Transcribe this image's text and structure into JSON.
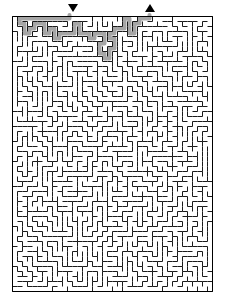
{
  "puzzle": {
    "type": "maze",
    "title": "Maze Puzzle",
    "description": "Rectangular perfect maze with solution path shown",
    "canvas": {
      "width": 227,
      "height": 301,
      "background": "#ffffff"
    },
    "frame": {
      "x": 12,
      "y": 16,
      "width": 200,
      "height": 275,
      "border_color": "#000000",
      "border_width": 1
    },
    "grid": {
      "columns": 40,
      "rows": 55,
      "cell_size": 5,
      "wall_color": "#1a1a1a",
      "wall_thickness": 1,
      "passage_color": "#ffffff"
    },
    "solution": {
      "label": "solution-path",
      "color": "#a6a6a6",
      "stroke_width": 4,
      "visible": true
    },
    "markers": [
      {
        "name": "entrance-marker",
        "glyph": "down-triangle",
        "symbol": "▼",
        "x": 68,
        "y": 4,
        "color": "#000000",
        "role": "entrance"
      },
      {
        "name": "exit-marker",
        "glyph": "up-triangle",
        "symbol": "▲",
        "x": 145,
        "y": 4,
        "color": "#000000",
        "role": "exit"
      }
    ],
    "entrance": {
      "column": 11,
      "row": 0
    },
    "exit": {
      "column": 27,
      "row": 0
    }
  },
  "maze_data": {
    "seed": 20240517,
    "algorithm": "recursive-backtracker",
    "solution_waypoints": [
      [
        11,
        0
      ],
      [
        11,
        1
      ],
      [
        11,
        2
      ],
      [
        11,
        3
      ],
      [
        12,
        3
      ],
      [
        13,
        3
      ],
      [
        13,
        4
      ],
      [
        13,
        5
      ],
      [
        14,
        5
      ],
      [
        15,
        5
      ],
      [
        15,
        6
      ],
      [
        15,
        7
      ],
      [
        16,
        7
      ],
      [
        17,
        7
      ],
      [
        17,
        8
      ],
      [
        17,
        9
      ],
      [
        18,
        9
      ],
      [
        19,
        9
      ],
      [
        19,
        10
      ],
      [
        19,
        11
      ],
      [
        20,
        11
      ],
      [
        21,
        11
      ],
      [
        21,
        12
      ],
      [
        21,
        13
      ],
      [
        22,
        13
      ],
      [
        23,
        13
      ],
      [
        23,
        12
      ],
      [
        24,
        12
      ],
      [
        25,
        12
      ],
      [
        25,
        11
      ],
      [
        25,
        10
      ],
      [
        26,
        10
      ],
      [
        27,
        10
      ],
      [
        27,
        9
      ],
      [
        27,
        8
      ],
      [
        27,
        7
      ],
      [
        27,
        6
      ],
      [
        27,
        5
      ],
      [
        27,
        4
      ],
      [
        27,
        3
      ],
      [
        27,
        2
      ],
      [
        27,
        1
      ],
      [
        27,
        0
      ]
    ]
  }
}
